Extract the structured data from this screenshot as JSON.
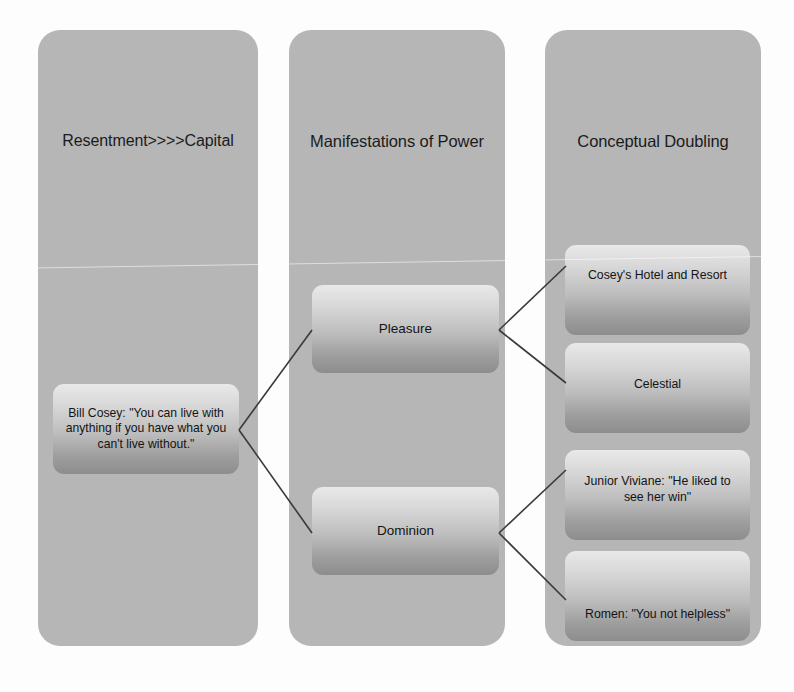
{
  "diagram": {
    "background_color": "#fdfdfd",
    "panel_color": "#b6b6b6",
    "connector_color": "#3a3a3a"
  },
  "columns": [
    {
      "id": "resentment-capital",
      "title": "Resentment>>>>Capital",
      "nodes": [
        {
          "id": "bill-cosey-quote",
          "label": "Bill Cosey: \"You can live with anything if you have what you can't live without.\""
        }
      ]
    },
    {
      "id": "manifestations-of-power",
      "title": "Manifestations of Power",
      "nodes": [
        {
          "id": "pleasure",
          "label": "Pleasure"
        },
        {
          "id": "dominion",
          "label": "Dominion"
        }
      ]
    },
    {
      "id": "conceptual-doubling",
      "title": "Conceptual Doubling",
      "nodes": [
        {
          "id": "coseys-hotel-and-resort",
          "label": "Cosey's Hotel and Resort"
        },
        {
          "id": "celestial",
          "label": "Celestial"
        },
        {
          "id": "junior-viviane-quote",
          "label": "Junior Viviane: \"He liked to see her win\""
        },
        {
          "id": "romen-quote",
          "label": "Romen: \"You not helpless\""
        }
      ]
    }
  ],
  "connections": [
    {
      "from": "bill-cosey-quote",
      "to": "pleasure"
    },
    {
      "from": "bill-cosey-quote",
      "to": "dominion"
    },
    {
      "from": "pleasure",
      "to": "coseys-hotel-and-resort"
    },
    {
      "from": "pleasure",
      "to": "celestial"
    },
    {
      "from": "dominion",
      "to": "junior-viviane-quote"
    },
    {
      "from": "dominion",
      "to": "romen-quote"
    }
  ]
}
